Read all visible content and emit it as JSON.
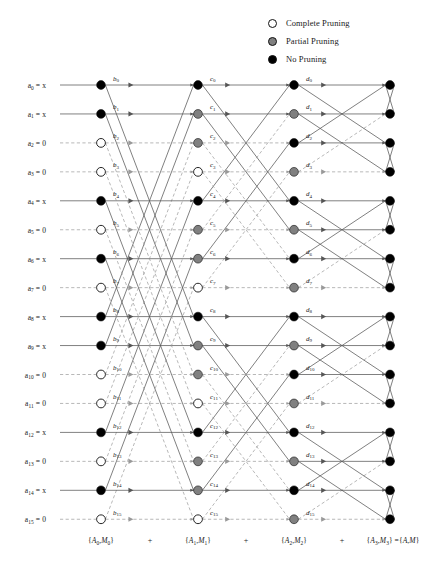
{
  "legend": {
    "items": [
      {
        "label": "Complete Pruning",
        "style": "complete",
        "color": "#ffffff",
        "icon": "circle-hollow-icon"
      },
      {
        "label": "Partial Pruning",
        "style": "partial",
        "color": "#808080",
        "icon": "circle-gray-icon"
      },
      {
        "label": "No Pruning",
        "style": "none",
        "color": "#000000",
        "icon": "circle-filled-icon"
      }
    ]
  },
  "inputs": [
    {
      "name": "a",
      "index": "0",
      "value": "x",
      "text": "a0 = x",
      "zero": false
    },
    {
      "name": "a",
      "index": "1",
      "value": "x",
      "text": "a1 = x",
      "zero": false
    },
    {
      "name": "a",
      "index": "2",
      "value": "0",
      "text": "a2 = 0",
      "zero": true
    },
    {
      "name": "a",
      "index": "3",
      "value": "0",
      "text": "a3 = 0",
      "zero": true
    },
    {
      "name": "a",
      "index": "4",
      "value": "x",
      "text": "a4 = x",
      "zero": false
    },
    {
      "name": "a",
      "index": "5",
      "value": "0",
      "text": "a5 = 0",
      "zero": true
    },
    {
      "name": "a",
      "index": "6",
      "value": "x",
      "text": "a6 = x",
      "zero": false
    },
    {
      "name": "a",
      "index": "7",
      "value": "0",
      "text": "a7 = 0",
      "zero": true
    },
    {
      "name": "a",
      "index": "8",
      "value": "x",
      "text": "a8 = x",
      "zero": false
    },
    {
      "name": "a",
      "index": "9",
      "value": "x",
      "text": "a9 = x",
      "zero": false
    },
    {
      "name": "a",
      "index": "10",
      "value": "0",
      "text": "a10 = 0",
      "zero": true
    },
    {
      "name": "a",
      "index": "11",
      "value": "0",
      "text": "a11 = 0",
      "zero": true
    },
    {
      "name": "a",
      "index": "12",
      "value": "x",
      "text": "a12 = x",
      "zero": false
    },
    {
      "name": "a",
      "index": "13",
      "value": "0",
      "text": "a13 = 0",
      "zero": true
    },
    {
      "name": "a",
      "index": "14",
      "value": "x",
      "text": "a14 = x",
      "zero": false
    },
    {
      "name": "a",
      "index": "15",
      "value": "0",
      "text": "a15 = 0",
      "zero": true
    }
  ],
  "stages": [
    {
      "id": "b",
      "prefix": "b",
      "butterfly_span": 8,
      "nodes": [
        "none",
        "none",
        "complete",
        "complete",
        "none",
        "complete",
        "none",
        "complete",
        "none",
        "none",
        "complete",
        "complete",
        "none",
        "complete",
        "none",
        "complete"
      ]
    },
    {
      "id": "c",
      "prefix": "c",
      "butterfly_span": 4,
      "nodes": [
        "none",
        "partial",
        "partial",
        "complete",
        "none",
        "partial",
        "partial",
        "complete",
        "none",
        "partial",
        "partial",
        "complete",
        "none",
        "partial",
        "partial",
        "complete"
      ]
    },
    {
      "id": "d",
      "prefix": "d",
      "butterfly_span": 2,
      "nodes": [
        "none",
        "partial",
        "none",
        "partial",
        "none",
        "partial",
        "none",
        "partial",
        "none",
        "partial",
        "none",
        "partial",
        "none",
        "partial",
        "none",
        "partial"
      ]
    },
    {
      "id": "out",
      "prefix": "",
      "butterfly_span": 1,
      "nodes": [
        "none",
        "none",
        "none",
        "none",
        "none",
        "none",
        "none",
        "none",
        "none",
        "none",
        "none",
        "none",
        "none",
        "none",
        "none",
        "none"
      ]
    }
  ],
  "bottom_sums": {
    "terms": [
      "{A0,M0}",
      "{A1,M1}",
      "{A2,M2}",
      "{A3,M3} ={A,M}"
    ],
    "operators": [
      "+",
      "+",
      "+"
    ]
  },
  "colors": {
    "complete": "#ffffff",
    "partial": "#808080",
    "none": "#000000",
    "edge_solid": "#555555",
    "edge_dashed": "#999999",
    "node_stroke": "#111111",
    "text": "#1a1a1a"
  }
}
